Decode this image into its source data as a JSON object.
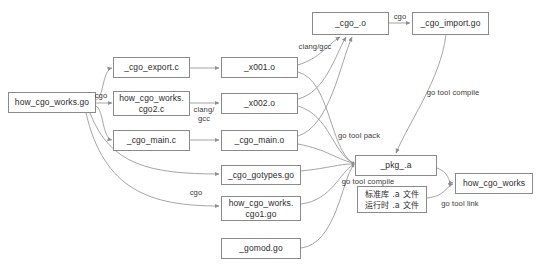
{
  "diagram": {
    "colors": {
      "background": "#ffffff",
      "node_border": "#8a8a8a",
      "node_fill": "#ffffff",
      "text": "#2b2b2b",
      "edge": "#9a9a9a",
      "label_text": "#3a3a3a"
    },
    "nodes": [
      {
        "id": "src",
        "label": "how_cgo_works.go",
        "x": 8,
        "y": 92,
        "w": 88,
        "h": 21
      },
      {
        "id": "cgo_export_c",
        "label": "_cgo_export.c",
        "x": 113,
        "y": 57,
        "w": 77,
        "h": 21
      },
      {
        "id": "cgo2_c",
        "label": "how_cgo_works.\ncgo2.c",
        "x": 113,
        "y": 91,
        "w": 77,
        "h": 25
      },
      {
        "id": "cgo_main_c",
        "label": "_cgo_main.c",
        "x": 113,
        "y": 130,
        "w": 77,
        "h": 21
      },
      {
        "id": "x001_o",
        "label": "_x001.o",
        "x": 221,
        "y": 57,
        "w": 77,
        "h": 21
      },
      {
        "id": "x002_o",
        "label": "_x002.o",
        "x": 221,
        "y": 93,
        "w": 77,
        "h": 21
      },
      {
        "id": "cgo_main_o",
        "label": "_cgo_main.o",
        "x": 221,
        "y": 130,
        "w": 77,
        "h": 21
      },
      {
        "id": "cgo_dot_o",
        "label": "_cgo_.o",
        "x": 312,
        "y": 12,
        "w": 77,
        "h": 23
      },
      {
        "id": "cgo_import_go",
        "label": "_cgo_import.go",
        "x": 412,
        "y": 12,
        "w": 77,
        "h": 23
      },
      {
        "id": "gotypes_go",
        "label": "_cgo_gotypes.go",
        "x": 221,
        "y": 165,
        "w": 80,
        "h": 20
      },
      {
        "id": "cgo1_go",
        "label": "how_cgo_works.\ncgo1.go",
        "x": 221,
        "y": 196,
        "w": 80,
        "h": 25
      },
      {
        "id": "gomod_go",
        "label": "_gomod.go",
        "x": 221,
        "y": 238,
        "w": 80,
        "h": 21
      },
      {
        "id": "pkg_a",
        "label": "_pkg_.a",
        "x": 355,
        "y": 155,
        "w": 82,
        "h": 21
      },
      {
        "id": "stdlib",
        "label": "标准库 .a 文件\n运行时 .a 文件",
        "x": 357,
        "y": 186,
        "w": 70,
        "h": 27,
        "cjk": true
      },
      {
        "id": "binary",
        "label": "how_cgo_works",
        "x": 455,
        "y": 173,
        "w": 78,
        "h": 21
      }
    ],
    "edge_labels": [
      {
        "id": "cgo_top",
        "text": "cgo",
        "x": 91,
        "y": 91,
        "w": 20
      },
      {
        "id": "clang_gcc_mid",
        "text": "clang/\ngcc",
        "x": 190,
        "y": 105,
        "w": 28
      },
      {
        "id": "clang_gcc_top",
        "text": "clang/gcc",
        "x": 292,
        "y": 42,
        "w": 42
      },
      {
        "id": "cgo_import_lbl",
        "text": "cgo",
        "x": 390,
        "y": 12,
        "w": 20
      },
      {
        "id": "go_tool_pack",
        "text": "go tool pack",
        "x": 330,
        "y": 131,
        "w": 52
      },
      {
        "id": "go_tool_comp_r",
        "text": "go tool compile",
        "x": 418,
        "y": 88,
        "w": 62
      },
      {
        "id": "cgo_bottom",
        "text": "cgo",
        "x": 186,
        "y": 188,
        "w": 20
      },
      {
        "id": "go_tool_comp_b",
        "text": "go tool compile",
        "x": 333,
        "y": 177,
        "w": 62
      },
      {
        "id": "go_tool_link",
        "text": "go tool link",
        "x": 432,
        "y": 199,
        "w": 50
      }
    ]
  }
}
